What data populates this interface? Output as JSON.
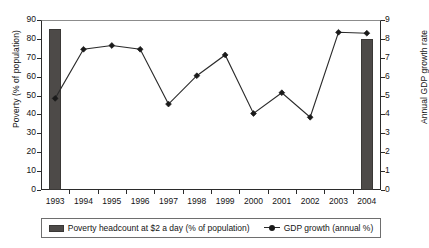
{
  "chart_data": {
    "type": "bar",
    "title": "",
    "subtitle": "",
    "xlabel": "",
    "ylabel": "Poverty (% of population)",
    "y2label": "Annual GDP growth rate",
    "grid": false,
    "legend_position": "bottom",
    "categories": [
      "1993",
      "1994",
      "1995",
      "1996",
      "1997",
      "1998",
      "1999",
      "2000",
      "2001",
      "2002",
      "2003",
      "2004"
    ],
    "ylim": [
      0,
      90
    ],
    "y_ticks": [
      0,
      10,
      20,
      30,
      40,
      50,
      60,
      70,
      80,
      90
    ],
    "y2lim": [
      0,
      9
    ],
    "y2_ticks": [
      0,
      1,
      2,
      3,
      4,
      5,
      6,
      7,
      8,
      9
    ],
    "series": [
      {
        "name": "Poverty headcount at $2 a day (% of population)",
        "type": "bar",
        "axis": "left",
        "color": "#4d4a48",
        "values": [
          85.5,
          null,
          null,
          null,
          null,
          null,
          null,
          null,
          null,
          null,
          null,
          80.0
        ]
      },
      {
        "name": "GDP growth (annual %)",
        "type": "line",
        "axis": "right",
        "color": "#2b2b2b",
        "marker": "diamond",
        "values": [
          4.85,
          7.45,
          7.65,
          7.45,
          4.55,
          6.05,
          7.15,
          4.05,
          5.15,
          3.85,
          8.35,
          8.3
        ]
      }
    ]
  },
  "legend": {
    "items": [
      {
        "label": "Poverty headcount at $2 a day (% of population)",
        "marker": "bar-swatch"
      },
      {
        "label": "GDP growth (annual %)",
        "marker": "line-marker-swatch"
      }
    ]
  },
  "axes": {
    "left_title": "Poverty (% of population)",
    "right_title": "Annual GDP growth rate",
    "left_tick_labels": [
      "90",
      "80",
      "70",
      "60",
      "50",
      "40",
      "30",
      "20",
      "10",
      "0"
    ],
    "right_tick_labels": [
      "9",
      "8",
      "7",
      "6",
      "5",
      "4",
      "3",
      "2",
      "1",
      "0"
    ],
    "x_tick_labels": [
      "1993",
      "1994",
      "1995",
      "1996",
      "1997",
      "1998",
      "1999",
      "2000",
      "2001",
      "2002",
      "2003",
      "2004"
    ]
  }
}
